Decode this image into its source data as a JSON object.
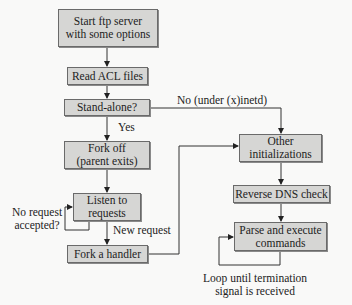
{
  "nodes": {
    "start": {
      "line1": "Start ftp server",
      "line2": "with some options"
    },
    "read_acl": {
      "label": "Read ACL files"
    },
    "standalone": {
      "label": "Stand-alone?"
    },
    "fork_off": {
      "line1": "Fork off",
      "line2": "(parent exits)"
    },
    "listen": {
      "line1": "Listen to",
      "line2": "requests"
    },
    "fork_handler": {
      "label": "Fork a handler"
    },
    "other_init": {
      "line1": "Other",
      "line2": "initializations"
    },
    "reverse_dns": {
      "label": "Reverse DNS check"
    },
    "parse_exec": {
      "line1": "Parse and execute",
      "line2": "commands"
    }
  },
  "edge_labels": {
    "no_inetd": "No (under (x)inetd)",
    "yes": "Yes",
    "no_request_1": "No request",
    "no_request_2": "accepted?",
    "new_request": "New request",
    "loop_1": "Loop until termination",
    "loop_2": "signal is received"
  },
  "colors": {
    "box_fill": "#d6d6d4",
    "line": "#333333",
    "background": "#f9f9f8"
  }
}
